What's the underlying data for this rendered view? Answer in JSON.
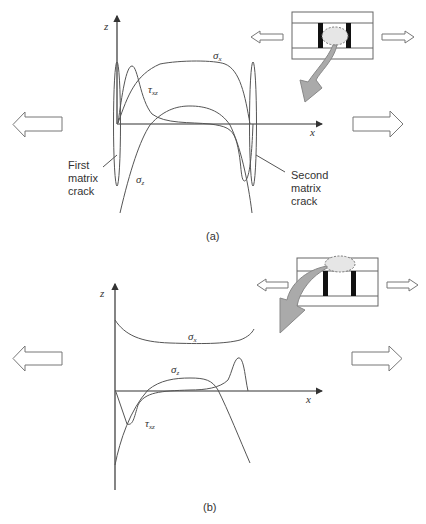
{
  "panel_a": {
    "caption": "(a)",
    "z_axis_label": "z",
    "x_axis_label": "x",
    "curves": {
      "sigma_x": {
        "symbol": "σ",
        "subscript": "x"
      },
      "tau_xz": {
        "symbol": "τ",
        "subscript": "xz"
      },
      "sigma_z": {
        "symbol": "σ",
        "subscript": "z"
      }
    },
    "first_crack_label": [
      "First",
      "matrix",
      "crack"
    ],
    "second_crack_label": [
      "Second",
      "matrix",
      "crack"
    ],
    "load_arrows": [
      "left-arrow",
      "right-arrow"
    ],
    "inset": "laminate with two matrix cracks, highlighted region between cracks"
  },
  "panel_b": {
    "caption": "(b)",
    "z_axis_label": "z",
    "x_axis_label": "x",
    "curves": {
      "sigma_x": {
        "symbol": "σ",
        "subscript": "x"
      },
      "sigma_z": {
        "symbol": "σ",
        "subscript": "z"
      },
      "tau_xz": {
        "symbol": "τ",
        "subscript": "xz"
      }
    },
    "load_arrows": [
      "left-arrow",
      "right-arrow"
    ],
    "inset": "laminate with two matrix cracks, highlighted region at top surface between cracks"
  },
  "colors": {
    "curve": "#555555",
    "axis": "#333333",
    "pointer_arrow_fill": "#aaaaaa",
    "highlight_fill": "#e6e6e6",
    "crack_fill": "#111111"
  }
}
